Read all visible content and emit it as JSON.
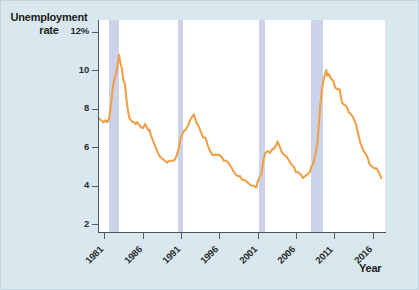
{
  "figure": {
    "background_color": "#d9e8ef",
    "plot_background_color": "#ffffff",
    "line_color": "#efa04a",
    "recession_band_color": "#ccd2e8",
    "axis_color": "#4d545b"
  },
  "labels": {
    "y_axis_title_line1": "Unemployment",
    "y_axis_title_line2": "rate",
    "x_axis_title": "Year"
  },
  "chart_data": {
    "type": "line",
    "title": "",
    "subtitle": "",
    "xlabel": "Year",
    "ylabel": "Unemployment rate",
    "grid": false,
    "legend": "none",
    "xlim": [
      1980.2,
      2017.6
    ],
    "ylim": [
      1.6,
      12.6
    ],
    "yticks": [
      2,
      4,
      6,
      8,
      10,
      12
    ],
    "ytick_labels": [
      "2",
      "4",
      "6",
      "8",
      "10",
      "12%"
    ],
    "xticks": [
      1981,
      1986,
      1991,
      1996,
      2001,
      2006,
      2011,
      2016
    ],
    "xtick_labels": [
      "1981",
      "1986",
      "1991",
      "1996",
      "2001",
      "2006",
      "2011",
      "2016"
    ],
    "series": [
      {
        "name": "Unemployment rate",
        "color": "#efa04a",
        "units": "percent",
        "x": [
          1980.3,
          1980.6,
          1980.9,
          1981.0,
          1981.2,
          1981.4,
          1981.6,
          1981.8,
          1982.0,
          1982.2,
          1982.4,
          1982.6,
          1982.8,
          1982.95,
          1983.1,
          1983.3,
          1983.5,
          1983.7,
          1983.9,
          1984.1,
          1984.3,
          1984.5,
          1984.7,
          1984.9,
          1985.1,
          1985.3,
          1985.5,
          1985.7,
          1985.9,
          1986.1,
          1986.3,
          1986.5,
          1986.7,
          1986.9,
          1987.1,
          1987.4,
          1987.7,
          1988.0,
          1988.3,
          1988.6,
          1988.9,
          1989.2,
          1989.5,
          1989.8,
          1990.1,
          1990.4,
          1990.7,
          1991.0,
          1991.3,
          1991.6,
          1991.9,
          1992.2,
          1992.5,
          1992.7,
          1993.0,
          1993.3,
          1993.6,
          1993.9,
          1994.2,
          1994.5,
          1994.8,
          1995.1,
          1995.4,
          1995.7,
          1996.0,
          1996.3,
          1996.6,
          1996.9,
          1997.2,
          1997.5,
          1997.8,
          1998.1,
          1998.4,
          1998.7,
          1999.0,
          1999.3,
          1999.6,
          1999.9,
          2000.2,
          2000.5,
          2000.8,
          2001.0,
          2001.2,
          2001.5,
          2001.8,
          2002.0,
          2002.3,
          2002.6,
          2002.9,
          2003.1,
          2003.4,
          2003.6,
          2003.9,
          2004.2,
          2004.5,
          2004.8,
          2005.1,
          2005.4,
          2005.7,
          2006.0,
          2006.3,
          2006.6,
          2006.9,
          2007.2,
          2007.5,
          2007.8,
          2008.0,
          2008.2,
          2008.5,
          2008.8,
          2009.0,
          2009.2,
          2009.4,
          2009.6,
          2009.8,
          2009.95,
          2010.1,
          2010.3,
          2010.5,
          2010.7,
          2010.9,
          2011.1,
          2011.4,
          2011.7,
          2012.0,
          2012.3,
          2012.6,
          2012.9,
          2013.2,
          2013.5,
          2013.8,
          2014.1,
          2014.4,
          2014.7,
          2015.0,
          2015.3,
          2015.6,
          2015.9,
          2016.2,
          2016.5,
          2016.8,
          2017.1
        ],
        "y": [
          7.5,
          7.4,
          7.3,
          7.3,
          7.4,
          7.3,
          7.4,
          7.9,
          8.6,
          9.3,
          9.6,
          9.9,
          10.4,
          10.8,
          10.4,
          10.1,
          9.5,
          9.3,
          8.5,
          7.9,
          7.5,
          7.4,
          7.3,
          7.3,
          7.2,
          7.3,
          7.2,
          7.1,
          7.0,
          7.0,
          7.2,
          7.1,
          6.9,
          6.9,
          6.6,
          6.3,
          6.0,
          5.7,
          5.5,
          5.4,
          5.3,
          5.2,
          5.3,
          5.3,
          5.3,
          5.5,
          5.9,
          6.5,
          6.8,
          6.9,
          7.1,
          7.4,
          7.6,
          7.7,
          7.3,
          7.1,
          6.8,
          6.5,
          6.5,
          6.1,
          5.8,
          5.6,
          5.6,
          5.6,
          5.6,
          5.5,
          5.3,
          5.3,
          5.2,
          5.0,
          4.8,
          4.6,
          4.5,
          4.5,
          4.3,
          4.3,
          4.2,
          4.1,
          4.0,
          4.0,
          3.9,
          4.2,
          4.4,
          4.6,
          5.4,
          5.7,
          5.8,
          5.7,
          5.9,
          5.9,
          6.1,
          6.3,
          6.0,
          5.7,
          5.6,
          5.5,
          5.3,
          5.1,
          5.0,
          4.7,
          4.7,
          4.6,
          4.4,
          4.5,
          4.6,
          4.7,
          5.0,
          5.1,
          5.6,
          6.2,
          7.3,
          8.3,
          9.0,
          9.5,
          9.8,
          10.0,
          9.7,
          9.8,
          9.6,
          9.5,
          9.4,
          9.1,
          9.0,
          9.0,
          8.3,
          8.2,
          8.1,
          7.8,
          7.7,
          7.5,
          7.2,
          6.7,
          6.2,
          5.9,
          5.7,
          5.5,
          5.1,
          5.0,
          4.9,
          4.9,
          4.7,
          4.4
        ]
      }
    ],
    "recession_bands": [
      {
        "label": "1981-82 recession",
        "start": 1981.6,
        "end": 1982.9
      },
      {
        "label": "1990-91 recession",
        "start": 1990.6,
        "end": 1991.3
      },
      {
        "label": "2001 recession",
        "start": 2001.2,
        "end": 2001.9
      },
      {
        "label": "2007-09 recession",
        "start": 2007.9,
        "end": 2009.5
      }
    ]
  }
}
